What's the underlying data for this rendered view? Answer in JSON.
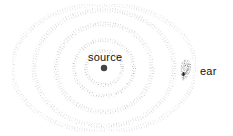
{
  "diagram": {
    "labels": {
      "source": "source",
      "ear": "ear"
    },
    "source_point": {
      "x": 104,
      "y": 68
    },
    "ear_point": {
      "x": 186,
      "y": 70
    },
    "wave_rings": [
      {
        "rx": 18,
        "ry": 17,
        "opacity": 0.55
      },
      {
        "rx": 30,
        "ry": 28,
        "opacity": 0.45
      },
      {
        "rx": 48,
        "ry": 44,
        "opacity": 0.35
      },
      {
        "rx": 70,
        "ry": 58,
        "opacity": 0.25
      },
      {
        "rx": 92,
        "ry": 64,
        "opacity": 0.15
      }
    ],
    "colors": {
      "dot": "#444444",
      "ring": "#9a9a9a",
      "ear": "#555555",
      "text": "#111111"
    }
  }
}
